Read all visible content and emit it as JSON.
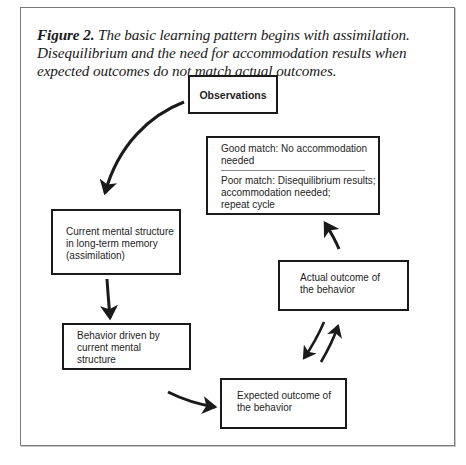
{
  "caption": {
    "label": "Figure 2.",
    "text": " The basic learning pattern begins with assimilation. Disequilibrium and the need for accommodation results when expected outcomes do not match actual outcomes."
  },
  "nodes": {
    "observations": "Observations",
    "current_structure": {
      "line1": "Current mental structure",
      "line2": "in long-term memory",
      "line3": "(assimilation)"
    },
    "behavior": {
      "line1": "Behavior driven by",
      "line2": "current mental",
      "line3": "structure"
    },
    "expected": {
      "line1": "Expected outcome of",
      "line2": "the behavior"
    },
    "actual": {
      "line1": "Actual outcome of",
      "line2": "the behavior"
    },
    "match": {
      "good_line1": "Good match: No accommodation",
      "good_line2": "needed",
      "poor_line1": "Poor match: Disequilibrium results;",
      "poor_line2": "accommodation needed;",
      "poor_line3": "repeat cycle"
    }
  },
  "colors": {
    "stroke": "#1a1a1a",
    "frame": "#7a7a7a"
  }
}
